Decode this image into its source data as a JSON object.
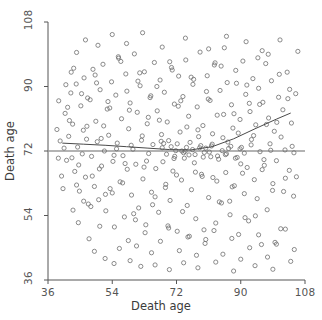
{
  "chart_data": {
    "type": "scatter",
    "title": "",
    "xlabel": "Death age",
    "ylabel": "Death age",
    "xlim": [
      36,
      108
    ],
    "ylim": [
      36,
      108
    ],
    "xticks": [
      36,
      54,
      72,
      90,
      108
    ],
    "yticks": [
      36,
      54,
      72,
      90,
      108
    ],
    "xticklabels": [
      "36",
      "54",
      "72",
      "90",
      "108"
    ],
    "yticklabels": [
      "36",
      "54",
      "72",
      "90",
      "108"
    ],
    "grid": false,
    "legend": null,
    "marker": {
      "shape": "open-circle",
      "size_px": 4.2,
      "color": "#6e6e6e",
      "fill": "none",
      "linewidth": 0.8
    },
    "reference_line": {
      "type": "horizontal",
      "y": 72.0,
      "color": "#9a9a9a",
      "linewidth": 1.4
    },
    "trend_line": {
      "type": "lowess",
      "color": "#4a4a4a",
      "linewidth": 1.0,
      "points": [
        [
          40.0,
          74.2
        ],
        [
          46.0,
          73.9
        ],
        [
          52.0,
          73.6
        ],
        [
          58.0,
          73.2
        ],
        [
          64.0,
          72.8
        ],
        [
          70.0,
          72.4
        ],
        [
          76.0,
          72.3
        ],
        [
          82.0,
          73.2
        ],
        [
          88.0,
          75.4
        ],
        [
          94.0,
          78.2
        ],
        [
          100.0,
          80.9
        ],
        [
          104.0,
          82.6
        ]
      ]
    },
    "points": [
      [
        40.5,
        72.8
      ],
      [
        41.2,
        69.4
      ],
      [
        41.8,
        76.1
      ],
      [
        42.4,
        88.2
      ],
      [
        42.9,
        79.5
      ],
      [
        43.5,
        66.3
      ],
      [
        43.9,
        90.7
      ],
      [
        44.3,
        73.1
      ],
      [
        44.8,
        60.8
      ],
      [
        45.2,
        84.6
      ],
      [
        45.6,
        71.2
      ],
      [
        46.1,
        92.4
      ],
      [
        46.5,
        64.7
      ],
      [
        46.9,
        78.9
      ],
      [
        47.3,
        57.2
      ],
      [
        47.8,
        86.3
      ],
      [
        48.2,
        70.5
      ],
      [
        48.6,
        94.8
      ],
      [
        49.0,
        62.1
      ],
      [
        49.4,
        80.3
      ],
      [
        49.8,
        74.6
      ],
      [
        50.2,
        58.4
      ],
      [
        50.6,
        89.1
      ],
      [
        51.0,
        67.8
      ],
      [
        51.4,
        96.2
      ],
      [
        51.8,
        72.0
      ],
      [
        52.2,
        55.3
      ],
      [
        52.6,
        83.7
      ],
      [
        53.0,
        76.4
      ],
      [
        53.4,
        61.5
      ],
      [
        53.8,
        91.3
      ],
      [
        54.2,
        69.1
      ],
      [
        54.6,
        50.8
      ],
      [
        55.0,
        87.6
      ],
      [
        55.4,
        74.2
      ],
      [
        55.8,
        97.9
      ],
      [
        56.2,
        63.4
      ],
      [
        56.6,
        81.0
      ],
      [
        57.0,
        70.7
      ],
      [
        57.4,
        53.6
      ],
      [
        57.8,
        93.5
      ],
      [
        58.2,
        66.9
      ],
      [
        58.6,
        78.2
      ],
      [
        59.0,
        85.4
      ],
      [
        59.4,
        59.7
      ],
      [
        59.8,
        72.5
      ],
      [
        60.2,
        99.1
      ],
      [
        60.6,
        68.3
      ],
      [
        61.0,
        82.8
      ],
      [
        61.4,
        56.1
      ],
      [
        61.8,
        90.2
      ],
      [
        62.2,
        75.0
      ],
      [
        62.6,
        64.2
      ],
      [
        63.0,
        94.1
      ],
      [
        63.4,
        51.4
      ],
      [
        63.8,
        79.6
      ],
      [
        64.2,
        71.3
      ],
      [
        64.6,
        86.9
      ],
      [
        65.0,
        60.5
      ],
      [
        65.4,
        73.8
      ],
      [
        65.8,
        96.7
      ],
      [
        66.2,
        67.1
      ],
      [
        66.6,
        83.2
      ],
      [
        67.0,
        54.9
      ],
      [
        67.4,
        91.8
      ],
      [
        67.8,
        76.6
      ],
      [
        68.2,
        69.0
      ],
      [
        68.6,
        88.4
      ],
      [
        69.0,
        62.7
      ],
      [
        69.4,
        80.1
      ],
      [
        69.8,
        74.9
      ],
      [
        70.2,
        58.2
      ],
      [
        70.6,
        95.3
      ],
      [
        71.0,
        66.4
      ],
      [
        71.4,
        85.1
      ],
      [
        71.8,
        72.1
      ],
      [
        72.2,
        49.6
      ],
      [
        72.6,
        92.9
      ],
      [
        73.0,
        77.3
      ],
      [
        73.4,
        63.9
      ],
      [
        73.8,
        87.2
      ],
      [
        74.2,
        70.0
      ],
      [
        74.6,
        97.4
      ],
      [
        75.0,
        56.8
      ],
      [
        75.4,
        81.7
      ],
      [
        75.8,
        74.4
      ],
      [
        76.2,
        61.2
      ],
      [
        76.6,
        90.6
      ],
      [
        77.0,
        68.7
      ],
      [
        77.4,
        53.1
      ],
      [
        77.8,
        84.3
      ],
      [
        78.2,
        76.0
      ],
      [
        78.6,
        99.6
      ],
      [
        79.0,
        65.5
      ],
      [
        79.4,
        79.1
      ],
      [
        79.8,
        71.6
      ],
      [
        80.2,
        47.3
      ],
      [
        80.6,
        93.0
      ],
      [
        81.0,
        59.0
      ],
      [
        81.4,
        86.1
      ],
      [
        81.8,
        73.4
      ],
      [
        82.2,
        64.6
      ],
      [
        82.6,
        96.0
      ],
      [
        83.0,
        51.9
      ],
      [
        83.4,
        82.0
      ],
      [
        83.8,
        69.7
      ],
      [
        84.2,
        88.9
      ],
      [
        84.6,
        57.5
      ],
      [
        85.0,
        75.7
      ],
      [
        85.4,
        100.8
      ],
      [
        85.8,
        66.0
      ],
      [
        86.2,
        91.1
      ],
      [
        86.6,
        72.7
      ],
      [
        87.0,
        54.2
      ],
      [
        87.4,
        84.9
      ],
      [
        87.8,
        78.4
      ],
      [
        88.2,
        62.3
      ],
      [
        88.6,
        94.5
      ],
      [
        89.0,
        70.2
      ],
      [
        89.4,
        48.7
      ],
      [
        89.8,
        80.8
      ],
      [
        90.2,
        73.0
      ],
      [
        90.6,
        97.1
      ],
      [
        91.0,
        60.1
      ],
      [
        91.4,
        87.8
      ],
      [
        91.8,
        67.4
      ],
      [
        92.2,
        52.5
      ],
      [
        92.6,
        83.0
      ],
      [
        93.0,
        75.2
      ],
      [
        93.4,
        92.2
      ],
      [
        93.8,
        64.0
      ],
      [
        94.2,
        79.3
      ],
      [
        94.6,
        58.7
      ],
      [
        95.0,
        89.5
      ],
      [
        95.4,
        71.8
      ],
      [
        95.8,
        45.9
      ],
      [
        96.2,
        85.6
      ],
      [
        96.6,
        68.0
      ],
      [
        97.0,
        96.4
      ],
      [
        97.4,
        55.6
      ],
      [
        97.8,
        81.2
      ],
      [
        98.2,
        74.0
      ],
      [
        98.6,
        91.6
      ],
      [
        99.0,
        62.9
      ],
      [
        99.4,
        77.5
      ],
      [
        100.0,
        69.3
      ],
      [
        100.6,
        87.0
      ],
      [
        101.2,
        50.3
      ],
      [
        101.8,
        83.5
      ],
      [
        102.4,
        72.3
      ],
      [
        103.0,
        94.0
      ],
      [
        103.6,
        66.6
      ],
      [
        104.2,
        79.8
      ],
      [
        104.8,
        59.4
      ],
      [
        105.4,
        88.0
      ],
      [
        42.0,
        80.5
      ],
      [
        43.2,
        95.1
      ],
      [
        44.6,
        68.1
      ],
      [
        45.9,
        77.8
      ],
      [
        47.1,
        86.8
      ],
      [
        48.4,
        65.0
      ],
      [
        49.6,
        91.0
      ],
      [
        50.9,
        75.5
      ],
      [
        52.1,
        59.9
      ],
      [
        53.3,
        84.0
      ],
      [
        54.5,
        70.8
      ],
      [
        55.7,
        98.3
      ],
      [
        56.9,
        63.1
      ],
      [
        58.1,
        88.7
      ],
      [
        59.3,
        73.6
      ],
      [
        60.5,
        52.8
      ],
      [
        61.7,
        93.8
      ],
      [
        62.9,
        67.5
      ],
      [
        64.1,
        81.4
      ],
      [
        65.3,
        57.0
      ],
      [
        66.5,
        90.0
      ],
      [
        67.7,
        74.7
      ],
      [
        68.9,
        61.8
      ],
      [
        70.1,
        96.9
      ],
      [
        71.3,
        69.9
      ],
      [
        72.5,
        84.5
      ],
      [
        73.7,
        55.1
      ],
      [
        74.9,
        78.7
      ],
      [
        76.1,
        92.6
      ],
      [
        77.3,
        66.1
      ],
      [
        78.5,
        72.9
      ],
      [
        79.7,
        50.0
      ],
      [
        80.9,
        86.5
      ],
      [
        82.1,
        76.8
      ],
      [
        83.3,
        63.6
      ],
      [
        84.5,
        95.7
      ],
      [
        85.7,
        71.0
      ],
      [
        86.9,
        58.0
      ],
      [
        88.1,
        82.4
      ],
      [
        89.3,
        77.0
      ],
      [
        90.5,
        65.8
      ],
      [
        91.7,
        90.4
      ],
      [
        92.9,
        73.7
      ],
      [
        94.1,
        53.9
      ],
      [
        95.3,
        85.0
      ],
      [
        96.5,
        69.6
      ],
      [
        97.7,
        99.0
      ],
      [
        98.9,
        61.0
      ],
      [
        100.1,
        80.0
      ],
      [
        101.3,
        75.9
      ],
      [
        102.5,
        64.4
      ],
      [
        103.7,
        89.2
      ],
      [
        104.9,
        71.5
      ],
      [
        41.5,
        84.2
      ],
      [
        42.7,
        70.1
      ],
      [
        44.0,
        62.5
      ],
      [
        45.4,
        88.0
      ],
      [
        46.8,
        75.3
      ],
      [
        48.0,
        56.5
      ],
      [
        49.2,
        93.2
      ],
      [
        50.4,
        67.0
      ],
      [
        51.6,
        79.0
      ],
      [
        52.8,
        85.8
      ],
      [
        54.0,
        60.3
      ],
      [
        55.2,
        72.6
      ],
      [
        56.4,
        97.0
      ],
      [
        57.6,
        68.5
      ],
      [
        58.8,
        83.4
      ],
      [
        60.0,
        54.5
      ],
      [
        61.2,
        91.5
      ],
      [
        62.4,
        76.2
      ],
      [
        63.6,
        69.2
      ],
      [
        64.8,
        87.4
      ],
      [
        66.0,
        59.2
      ],
      [
        67.2,
        80.6
      ],
      [
        68.4,
        74.1
      ],
      [
        69.6,
        51.1
      ],
      [
        70.8,
        94.6
      ],
      [
        72.0,
        65.3
      ],
      [
        73.2,
        86.0
      ],
      [
        74.4,
        71.9
      ],
      [
        75.6,
        48.2
      ],
      [
        76.8,
        92.0
      ],
      [
        78.0,
        77.9
      ],
      [
        79.2,
        64.9
      ],
      [
        80.4,
        88.6
      ],
      [
        81.6,
        70.4
      ],
      [
        82.8,
        96.6
      ],
      [
        84.0,
        57.8
      ],
      [
        85.2,
        82.2
      ],
      [
        86.4,
        74.5
      ],
      [
        87.6,
        62.0
      ],
      [
        88.8,
        90.9
      ],
      [
        90.0,
        68.4
      ],
      [
        91.2,
        53.4
      ],
      [
        92.4,
        85.3
      ],
      [
        93.6,
        76.3
      ],
      [
        94.8,
        98.0
      ],
      [
        96.0,
        66.8
      ],
      [
        97.2,
        79.4
      ],
      [
        98.4,
        72.2
      ],
      [
        99.6,
        46.5
      ],
      [
        100.8,
        93.4
      ],
      [
        102.0,
        60.7
      ],
      [
        103.2,
        86.6
      ],
      [
        104.4,
        73.3
      ],
      [
        105.6,
        64.8
      ],
      [
        56.0,
        44.8
      ],
      [
        58.5,
        47.0
      ],
      [
        60.8,
        45.5
      ],
      [
        63.2,
        49.2
      ],
      [
        65.0,
        43.6
      ],
      [
        67.5,
        46.8
      ],
      [
        69.8,
        50.5
      ],
      [
        72.8,
        44.2
      ],
      [
        75.2,
        48.0
      ],
      [
        77.6,
        42.9
      ],
      [
        80.0,
        46.2
      ],
      [
        82.5,
        49.8
      ],
      [
        85.0,
        43.2
      ],
      [
        87.5,
        47.6
      ],
      [
        90.0,
        41.8
      ],
      [
        92.5,
        45.0
      ],
      [
        95.0,
        48.6
      ],
      [
        97.5,
        42.4
      ],
      [
        100.0,
        46.0
      ],
      [
        102.5,
        50.2
      ],
      [
        105.0,
        44.5
      ],
      [
        52.0,
        42.0
      ],
      [
        54.5,
        40.6
      ],
      [
        59.0,
        41.4
      ],
      [
        62.0,
        39.8
      ],
      [
        66.0,
        40.2
      ],
      [
        70.0,
        38.9
      ],
      [
        74.0,
        40.8
      ],
      [
        78.0,
        39.4
      ],
      [
        83.0,
        41.0
      ],
      [
        88.0,
        38.5
      ],
      [
        94.0,
        40.0
      ],
      [
        99.0,
        39.0
      ],
      [
        104.0,
        41.2
      ],
      [
        47.5,
        47.5
      ],
      [
        49.0,
        44.0
      ],
      [
        50.5,
        51.0
      ],
      [
        43.0,
        55.5
      ],
      [
        44.5,
        52.0
      ],
      [
        46.0,
        58.0
      ],
      [
        39.8,
        65.0
      ],
      [
        40.2,
        61.5
      ],
      [
        38.9,
        70.0
      ],
      [
        39.4,
        74.8
      ],
      [
        38.5,
        78.0
      ],
      [
        40.8,
        82.5
      ],
      [
        39.0,
        86.0
      ],
      [
        41.0,
        90.5
      ],
      [
        42.5,
        94.0
      ],
      [
        44.0,
        99.5
      ],
      [
        46.5,
        103.0
      ],
      [
        50.0,
        101.5
      ],
      [
        54.0,
        104.5
      ],
      [
        58.0,
        102.0
      ],
      [
        62.5,
        105.0
      ],
      [
        68.0,
        101.0
      ],
      [
        74.5,
        103.5
      ],
      [
        81.0,
        100.5
      ],
      [
        86.0,
        104.0
      ],
      [
        91.5,
        102.5
      ],
      [
        96.0,
        100.0
      ],
      [
        101.0,
        103.0
      ],
      [
        106.0,
        99.8
      ],
      [
        73.5,
        72.0
      ],
      [
        74.0,
        71.5
      ],
      [
        74.8,
        73.0
      ],
      [
        75.5,
        70.9
      ],
      [
        76.5,
        72.4
      ],
      [
        77.2,
        71.0
      ],
      [
        78.8,
        73.5
      ],
      [
        79.5,
        70.3
      ],
      [
        80.2,
        72.8
      ],
      [
        81.2,
        71.7
      ],
      [
        82.0,
        73.9
      ],
      [
        83.5,
        70.6
      ],
      [
        84.8,
        72.1
      ],
      [
        86.0,
        71.2
      ],
      [
        87.2,
        73.3
      ],
      [
        88.5,
        70.0
      ],
      [
        89.8,
        72.6
      ],
      [
        91.0,
        71.4
      ],
      [
        72.2,
        74.0
      ],
      [
        71.5,
        70.5
      ],
      [
        70.5,
        73.2
      ],
      [
        69.2,
        71.1
      ],
      [
        68.0,
        72.9
      ]
    ]
  },
  "axes": {
    "x_title": "Death age",
    "y_title": "Death age"
  }
}
